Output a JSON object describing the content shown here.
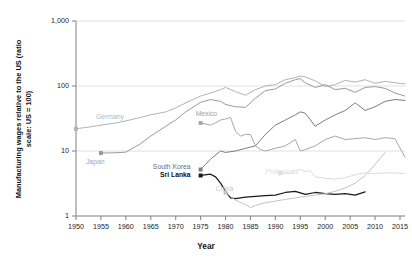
{
  "chart_data": {
    "type": "line",
    "title": "",
    "xlabel": "Year",
    "ylabel": "Manufacturing wages relative to the US (ratio scale: US = 100)",
    "yscale": "log",
    "ylim": [
      1,
      1000
    ],
    "xlim": [
      1950,
      2016
    ],
    "grid": true,
    "legend_position": "inline-labels",
    "ytick_labels": [
      "1,000",
      "100",
      "10",
      "1"
    ],
    "ytick_values": [
      1000,
      100,
      10,
      1
    ],
    "xtick_labels": [
      "1950",
      "1955",
      "1960",
      "1965",
      "1970",
      "1975",
      "1980",
      "1985",
      "1990",
      "1995",
      "2000",
      "2005",
      "2010",
      "2015"
    ],
    "xtick_values": [
      1950,
      1955,
      1960,
      1965,
      1970,
      1975,
      1980,
      1985,
      1990,
      1995,
      2000,
      2005,
      2010,
      2015
    ],
    "series": [
      {
        "name": "Germany",
        "color": "#b3b3b3",
        "label_x": 1954,
        "label_y": 33,
        "marker_x": 1950,
        "marker_y": 22,
        "x": [
          1950,
          1952,
          1955,
          1958,
          1960,
          1963,
          1965,
          1968,
          1970,
          1972,
          1975,
          1977,
          1979,
          1980,
          1982,
          1984,
          1986,
          1988,
          1990,
          1992,
          1994,
          1995,
          1996,
          1998,
          2000,
          2002,
          2004,
          2006,
          2008,
          2010,
          2012,
          2014,
          2016
        ],
        "values": [
          22,
          23,
          25,
          27,
          29,
          33,
          36,
          40,
          46,
          55,
          70,
          78,
          88,
          95,
          82,
          72,
          88,
          100,
          105,
          125,
          135,
          142,
          138,
          120,
          98,
          105,
          122,
          115,
          125,
          110,
          118,
          112,
          108
        ]
      },
      {
        "name": "Japan",
        "color": "#9a9a9a",
        "label_x": 1952,
        "label_y": 6.6,
        "marker_x": 1955,
        "marker_y": 9.3,
        "x": [
          1955,
          1958,
          1960,
          1963,
          1965,
          1968,
          1970,
          1972,
          1975,
          1977,
          1979,
          1980,
          1982,
          1984,
          1986,
          1988,
          1990,
          1992,
          1994,
          1995,
          1996,
          1998,
          2000,
          2002,
          2004,
          2006,
          2008,
          2010,
          2012,
          2014,
          2016
        ],
        "values": [
          9.3,
          9.4,
          9.6,
          13,
          17,
          24,
          30,
          40,
          56,
          62,
          58,
          52,
          48,
          47,
          65,
          85,
          90,
          110,
          125,
          130,
          112,
          95,
          105,
          88,
          92,
          80,
          95,
          98,
          92,
          78,
          70
        ]
      },
      {
        "name": "Mexico",
        "color": "#a8a8a8",
        "label_x": 1974,
        "label_y": 36,
        "marker_x": 1975,
        "marker_y": 27,
        "x": [
          1975,
          1977,
          1978,
          1979,
          1980,
          1981,
          1982,
          1983,
          1984,
          1985,
          1986,
          1987,
          1988,
          1990,
          1992,
          1994,
          1995,
          1996,
          1998,
          2000,
          2002,
          2004,
          2006,
          2008,
          2010,
          2012,
          2014,
          2016
        ],
        "values": [
          27,
          25,
          27,
          30,
          31,
          33,
          20,
          17,
          18,
          18,
          12,
          10.5,
          10,
          11,
          12,
          15,
          10,
          10.5,
          12,
          15,
          17,
          15,
          15.5,
          16,
          15,
          16,
          15.5,
          8
        ]
      },
      {
        "name": "South Korea",
        "color": "#7d7d7d",
        "label_x": 1973,
        "label_y": 5.5,
        "marker_x": 1975,
        "marker_y": 5.2,
        "x": [
          1975,
          1977,
          1979,
          1980,
          1982,
          1984,
          1986,
          1988,
          1990,
          1992,
          1994,
          1995,
          1996,
          1998,
          2000,
          2002,
          2004,
          2006,
          2008,
          2010,
          2012,
          2014,
          2016
        ],
        "values": [
          5.2,
          7.5,
          10,
          9.5,
          10,
          11,
          12,
          18,
          25,
          30,
          36,
          40,
          38,
          24,
          30,
          36,
          42,
          55,
          42,
          48,
          58,
          62,
          60
        ]
      },
      {
        "name": "Sri Lanka",
        "color": "#1a1a1a",
        "label_x": 1973,
        "label_y": 4.2,
        "marker_x": 1975,
        "marker_y": 4.2,
        "x": [
          1975,
          1977,
          1978,
          1979,
          1980,
          1981,
          1982,
          1984,
          1986,
          1988,
          1990,
          1992,
          1994,
          1996,
          1998,
          2000,
          2002,
          2004,
          2006,
          2008
        ],
        "values": [
          4.2,
          4.4,
          4.0,
          3.2,
          2.4,
          1.9,
          1.85,
          1.95,
          2.0,
          2.05,
          2.1,
          2.3,
          2.4,
          2.15,
          2.3,
          2.2,
          2.15,
          2.2,
          2.1,
          2.35
        ]
      },
      {
        "name": "China",
        "color": "#c4c4c4",
        "label_x": 1978,
        "label_y": 2.6,
        "marker_x": 1980,
        "marker_y": 2.3,
        "x": [
          1980,
          1982,
          1984,
          1985,
          1986,
          1988,
          1990,
          1992,
          1994,
          1996,
          1998,
          2000,
          2002,
          2004,
          2006,
          2008,
          2010,
          2012
        ],
        "values": [
          2.3,
          1.75,
          1.5,
          1.35,
          1.45,
          1.6,
          1.7,
          1.8,
          1.9,
          2.0,
          2.1,
          2.2,
          2.4,
          2.7,
          3.2,
          4.2,
          6.2,
          9.5
        ]
      },
      {
        "name": "Philippines",
        "color": "#dcdcdc",
        "label_x": 1988,
        "label_y": 4.6,
        "marker_x": 1991,
        "marker_y": 4.6,
        "x": [
          1991,
          1993,
          1994,
          1995,
          1996,
          1997,
          1998,
          2000,
          2002,
          2004,
          2006,
          2008,
          2010,
          2012,
          2014,
          2016
        ],
        "values": [
          4.6,
          4.5,
          5.0,
          5.2,
          4.8,
          5.0,
          4.0,
          3.8,
          3.7,
          3.9,
          4.3,
          4.6,
          4.5,
          4.6,
          4.6,
          4.5
        ]
      }
    ]
  }
}
